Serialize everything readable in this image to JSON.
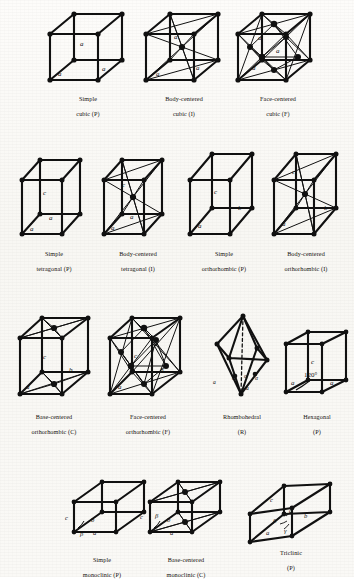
{
  "figure": {
    "background_color": "#fbfaf7",
    "ink_color": "#111111",
    "rows": 4
  },
  "lattices": [
    {
      "id": "simple-cubic",
      "caption_line1": "Simple",
      "caption_line2": "cubic (P)",
      "system": "cubic",
      "centering": "P",
      "edge_labels": [
        "a",
        "a",
        "a"
      ],
      "angle_labels": [],
      "lattice_points": 8,
      "has_body_center": false,
      "has_face_centers": false,
      "has_base_centers": false,
      "has_dashed_axis": false
    },
    {
      "id": "body-centered-cubic",
      "caption_line1": "Body-centered",
      "caption_line2": "cubic (I)",
      "system": "cubic",
      "centering": "I",
      "edge_labels": [
        "a",
        "a",
        "a"
      ],
      "angle_labels": [],
      "lattice_points": 9,
      "has_body_center": true,
      "has_face_centers": false,
      "has_base_centers": false,
      "has_dashed_axis": false
    },
    {
      "id": "face-centered-cubic",
      "caption_line1": "Face-centered",
      "caption_line2": "cubic (F)",
      "system": "cubic",
      "centering": "F",
      "edge_labels": [
        "a",
        "a",
        "a"
      ],
      "angle_labels": [],
      "lattice_points": 14,
      "has_body_center": false,
      "has_face_centers": true,
      "has_base_centers": false,
      "has_dashed_axis": false
    },
    {
      "id": "simple-tetragonal",
      "caption_line1": "Simple",
      "caption_line2": "tetragonal (P)",
      "system": "tetragonal",
      "centering": "P",
      "edge_labels": [
        "a",
        "a",
        "c"
      ],
      "angle_labels": [],
      "lattice_points": 8,
      "has_body_center": false,
      "has_face_centers": false,
      "has_base_centers": false,
      "has_dashed_axis": false
    },
    {
      "id": "body-centered-tetragonal",
      "caption_line1": "Body-centered",
      "caption_line2": "tetragonal (I)",
      "system": "tetragonal",
      "centering": "I",
      "edge_labels": [
        "a",
        "a",
        "c"
      ],
      "angle_labels": [],
      "lattice_points": 9,
      "has_body_center": true,
      "has_face_centers": false,
      "has_base_centers": false,
      "has_dashed_axis": false
    },
    {
      "id": "simple-orthorhombic",
      "caption_line1": "Simple",
      "caption_line2": "orthorhombic (P)",
      "system": "orthorhombic",
      "centering": "P",
      "edge_labels": [
        "a",
        "b",
        "c"
      ],
      "angle_labels": [],
      "lattice_points": 8,
      "has_body_center": false,
      "has_face_centers": false,
      "has_base_centers": false,
      "has_dashed_axis": false
    },
    {
      "id": "body-centered-orthorhombic",
      "caption_line1": "Body-centered",
      "caption_line2": "orthorhombic (I)",
      "system": "orthorhombic",
      "centering": "I",
      "edge_labels": [
        "a",
        "b",
        "c"
      ],
      "angle_labels": [],
      "lattice_points": 9,
      "has_body_center": true,
      "has_face_centers": false,
      "has_base_centers": false,
      "has_dashed_axis": false
    },
    {
      "id": "base-centered-orthorhombic",
      "caption_line1": "Base-centered",
      "caption_line2": "orthorhombic (C)",
      "system": "orthorhombic",
      "centering": "C",
      "edge_labels": [
        "a",
        "b",
        "c"
      ],
      "angle_labels": [],
      "lattice_points": 10,
      "has_body_center": false,
      "has_face_centers": false,
      "has_base_centers": true,
      "has_dashed_axis": false
    },
    {
      "id": "face-centered-orthorhombic",
      "caption_line1": "Face-centered",
      "caption_line2": "orthorhombic (F)",
      "system": "orthorhombic",
      "centering": "F",
      "edge_labels": [
        "a",
        "b",
        "c"
      ],
      "angle_labels": [],
      "lattice_points": 14,
      "has_body_center": false,
      "has_face_centers": true,
      "has_base_centers": false,
      "has_dashed_axis": false
    },
    {
      "id": "rhombohedral",
      "caption_line1": "Rhombohedral",
      "caption_line2": "(R)",
      "system": "rhombohedral",
      "centering": "R",
      "edge_labels": [
        "a",
        "a",
        "a"
      ],
      "angle_labels": [
        "α",
        "α",
        "α"
      ],
      "lattice_points": 8,
      "has_body_center": false,
      "has_face_centers": false,
      "has_base_centers": false,
      "has_dashed_axis": true
    },
    {
      "id": "hexagonal",
      "caption_line1": "Hexagonal",
      "caption_line2": "(P)",
      "system": "hexagonal",
      "centering": "P",
      "edge_labels": [
        "a",
        "a",
        "c"
      ],
      "angle_labels": [
        "120°"
      ],
      "lattice_points": 8,
      "has_body_center": false,
      "has_face_centers": false,
      "has_base_centers": false,
      "has_dashed_axis": false
    },
    {
      "id": "simple-monoclinic",
      "caption_line1": "Simple",
      "caption_line2": "monoclinic (P)",
      "system": "monoclinic",
      "centering": "P",
      "edge_labels": [
        "a",
        "b",
        "c"
      ],
      "angle_labels": [
        "β"
      ],
      "lattice_points": 8,
      "has_body_center": false,
      "has_face_centers": false,
      "has_base_centers": false,
      "has_dashed_axis": false
    },
    {
      "id": "base-centered-monoclinic",
      "caption_line1": "Base-centered",
      "caption_line2": "monoclinic (C)",
      "system": "monoclinic",
      "centering": "C",
      "edge_labels": [
        "a",
        "b",
        "c"
      ],
      "angle_labels": [
        "β"
      ],
      "lattice_points": 10,
      "has_body_center": false,
      "has_face_centers": false,
      "has_base_centers": true,
      "has_dashed_axis": false
    },
    {
      "id": "triclinic",
      "caption_line1": "Triclinic",
      "caption_line2": "(P)",
      "system": "triclinic",
      "centering": "P",
      "edge_labels": [
        "a",
        "b",
        "c"
      ],
      "angle_labels": [
        "α",
        "β",
        "γ"
      ],
      "lattice_points": 8,
      "has_body_center": false,
      "has_face_centers": false,
      "has_base_centers": false,
      "has_dashed_axis": false
    }
  ]
}
